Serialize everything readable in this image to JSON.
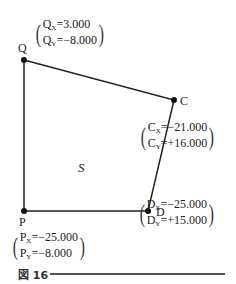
{
  "figure": {
    "caption": "図 16",
    "region_label": "S",
    "points": [
      {
        "name": "Q",
        "x_label": "Q",
        "x_sub": "X",
        "x_val": "=3.000",
        "y_label": "Q",
        "y_sub": "Y",
        "y_val": "=−8.000"
      },
      {
        "name": "C",
        "x_label": "C",
        "x_sub": "X",
        "x_val": "=−21.000",
        "y_label": "C",
        "y_sub": "Y",
        "y_val": "=+16.000"
      },
      {
        "name": "D",
        "x_label": "D",
        "x_sub": "X",
        "x_val": "=−25.000",
        "y_label": "D",
        "y_sub": "Y",
        "y_val": "=+15.000"
      },
      {
        "name": "P",
        "x_label": "P",
        "x_sub": "X",
        "x_val": "=−25.000",
        "y_label": "P",
        "y_sub": "Y",
        "y_val": "=−8.000"
      }
    ]
  }
}
